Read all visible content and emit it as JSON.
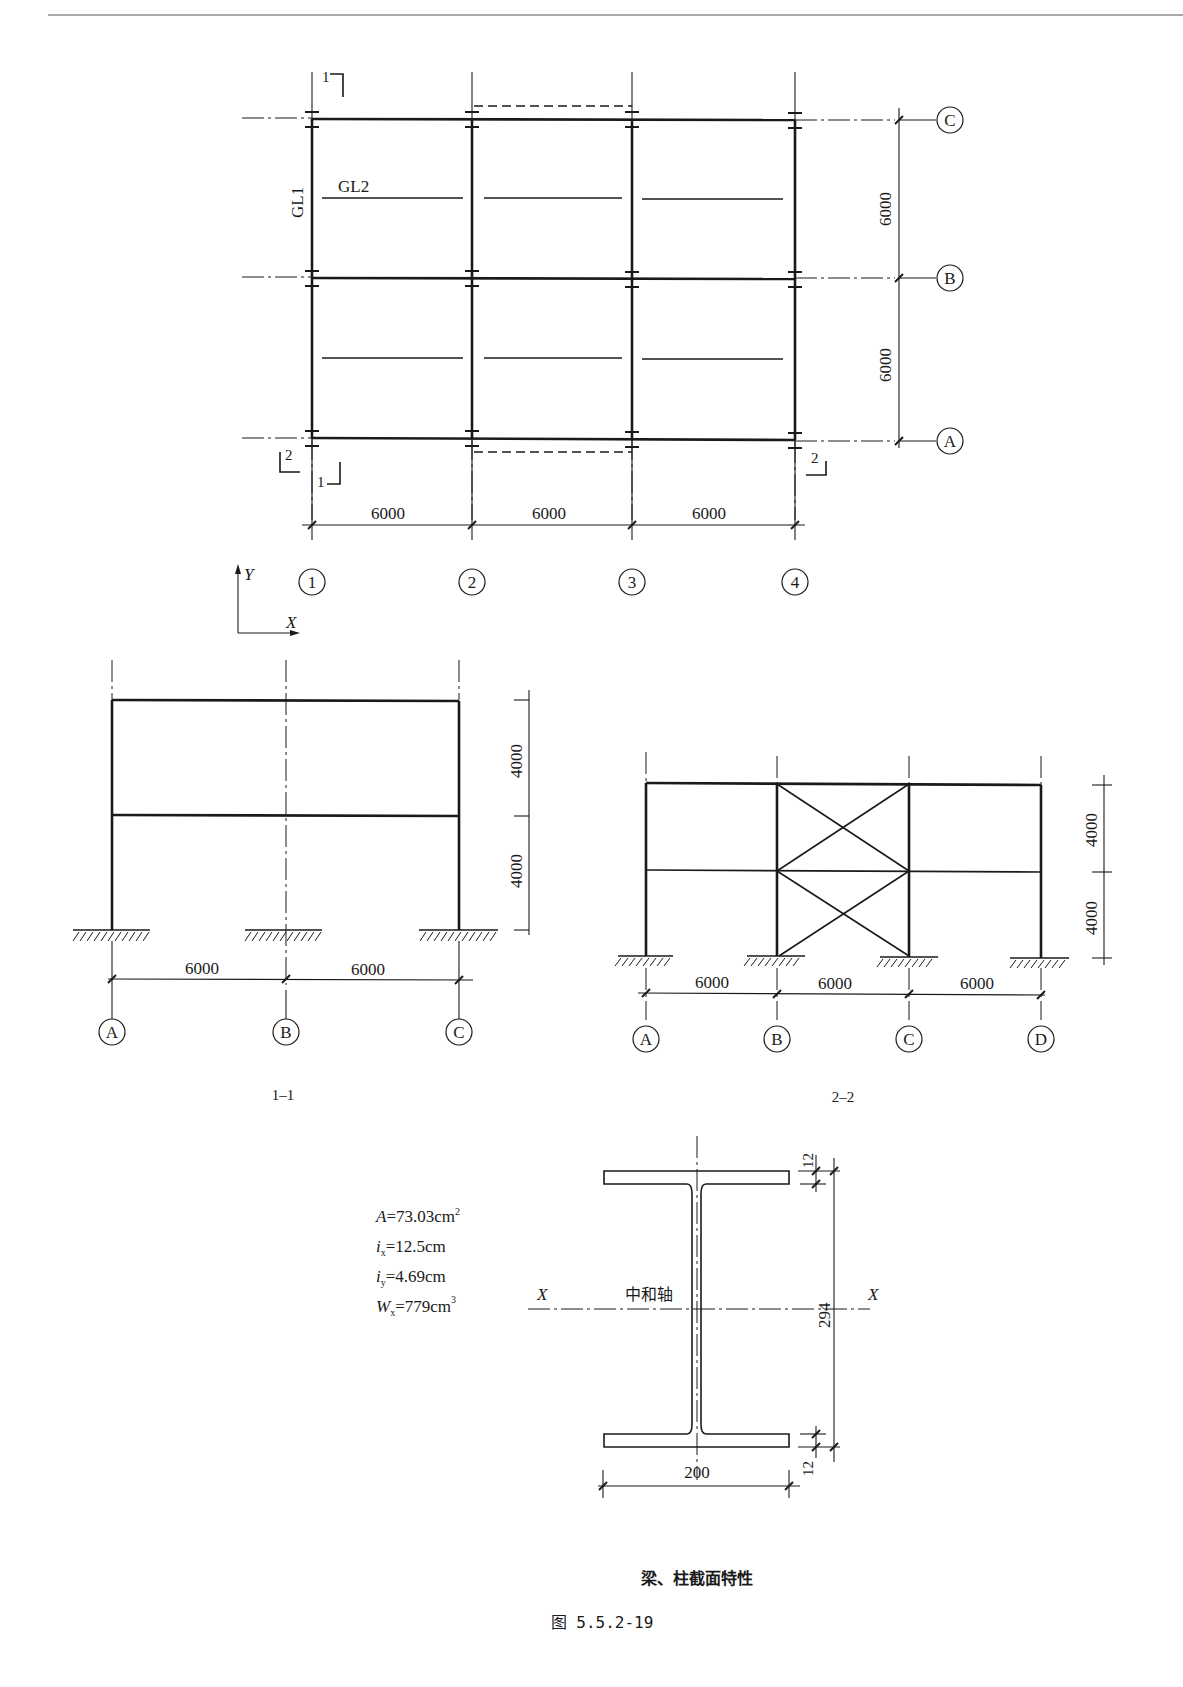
{
  "page": {
    "header_rule": true,
    "figure_caption": "图 5.5.2-19",
    "section_caption": "梁、柱截面特性"
  },
  "plan": {
    "name": "floor-plan",
    "member_labels": {
      "column": "GL1",
      "beam": "GL2"
    },
    "section_marks": {
      "s1_top": "1",
      "s1_bottom": "1",
      "s2_left": "2",
      "s2_right": "2"
    },
    "x_axes": [
      "1",
      "2",
      "3",
      "4"
    ],
    "y_axes": [
      "A",
      "B",
      "C"
    ],
    "x_spans": [
      "6000",
      "6000",
      "6000"
    ],
    "y_spans": [
      "6000",
      "6000"
    ],
    "coord": {
      "x": "X",
      "y": "Y"
    }
  },
  "section_1_1": {
    "title": "1–1",
    "axes": [
      "A",
      "B",
      "C"
    ],
    "spans": [
      "6000",
      "6000"
    ],
    "heights": [
      "4000",
      "4000"
    ]
  },
  "section_2_2": {
    "title": "2–2",
    "axes": [
      "A",
      "B",
      "C",
      "D"
    ],
    "spans": [
      "6000",
      "6000",
      "6000"
    ],
    "heights": [
      "4000",
      "4000"
    ]
  },
  "i_section": {
    "props": [
      {
        "sym": "A",
        "sub": "",
        "val": "=73.03cm",
        "sup": "2"
      },
      {
        "sym": "i",
        "sub": "x",
        "val": "=12.5cm",
        "sup": ""
      },
      {
        "sym": "i",
        "sub": "y",
        "val": "=4.69cm",
        "sup": ""
      },
      {
        "sym": "W",
        "sub": "x",
        "val": "=779cm",
        "sup": "3"
      }
    ],
    "neutral_axis": "中和轴",
    "axis_label": "X",
    "depth": "294",
    "width": "200",
    "flange_top": "12",
    "flange_bottom": "12"
  }
}
